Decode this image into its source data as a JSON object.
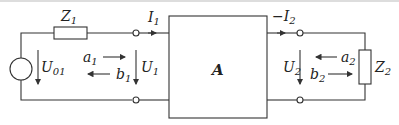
{
  "diagram": {
    "type": "two-port network circuit",
    "source": {
      "label": "U",
      "sub": "01"
    },
    "impedance1": {
      "label": "Z",
      "sub": "1"
    },
    "impedance2": {
      "label": "Z",
      "sub": "2"
    },
    "current1": {
      "label": "I",
      "sub": "1"
    },
    "current2": {
      "prefix": "−",
      "label": "I",
      "sub": "2"
    },
    "voltage1": {
      "label": "U",
      "sub": "1"
    },
    "voltage2": {
      "label": "U",
      "sub": "2"
    },
    "wave_a1": {
      "label": "a",
      "sub": "1"
    },
    "wave_b1": {
      "label": "b",
      "sub": "1"
    },
    "wave_a2": {
      "label": "a",
      "sub": "2"
    },
    "wave_b2": {
      "label": "b",
      "sub": "2"
    },
    "network": {
      "label": "A"
    }
  }
}
